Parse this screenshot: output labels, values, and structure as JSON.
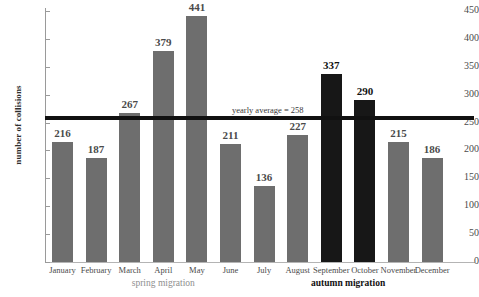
{
  "chart_data": {
    "type": "bar",
    "title": "",
    "xlabel": "",
    "ylabel": "number of collisions",
    "categories": [
      "January",
      "February",
      "March",
      "April",
      "May",
      "June",
      "July",
      "August",
      "September",
      "October",
      "November",
      "December"
    ],
    "values": [
      216,
      187,
      267,
      379,
      441,
      211,
      136,
      227,
      337,
      290,
      215,
      186
    ],
    "series": [
      {
        "name": "number of collisions",
        "values": [
          216,
          187,
          267,
          379,
          441,
          211,
          136,
          227,
          337,
          290,
          215,
          186
        ]
      }
    ],
    "bar_colors": [
      "#6e6e6e",
      "#6e6e6e",
      "#6e6e6e",
      "#6e6e6e",
      "#6e6e6e",
      "#6e6e6e",
      "#6e6e6e",
      "#6e6e6e",
      "#171717",
      "#171717",
      "#6e6e6e",
      "#6e6e6e"
    ],
    "highlighted_categories": [
      "September",
      "October"
    ],
    "ylim": [
      0,
      450
    ],
    "yticks": [
      0,
      50,
      100,
      150,
      200,
      250,
      300,
      350,
      400,
      450
    ],
    "ytick_labels": [
      "0",
      "50",
      "100",
      "150",
      "200",
      "250",
      "300",
      "350",
      "400",
      "450"
    ],
    "grid": false,
    "legend": "none",
    "annotations": [
      {
        "name": "yearly-average",
        "text": "yearly average = 258",
        "value": 258,
        "type": "horizontal-line",
        "color": "#111111"
      }
    ],
    "group_labels": [
      {
        "name": "spring-migration",
        "text": "spring migration",
        "color": "#8e8e8e",
        "months": [
          "March",
          "April",
          "May"
        ]
      },
      {
        "name": "autumn-migration",
        "text": "autumn migration",
        "color": "#111111",
        "months": [
          "September",
          "October"
        ]
      }
    ],
    "colors": {
      "bar_gray": "#6e6e6e",
      "bar_dark": "#171717",
      "average_line": "#111111",
      "axis": "#9a9a9a",
      "text": "#4a4a4a",
      "spring_label": "#8e8e8e",
      "autumn_label": "#111111"
    }
  }
}
